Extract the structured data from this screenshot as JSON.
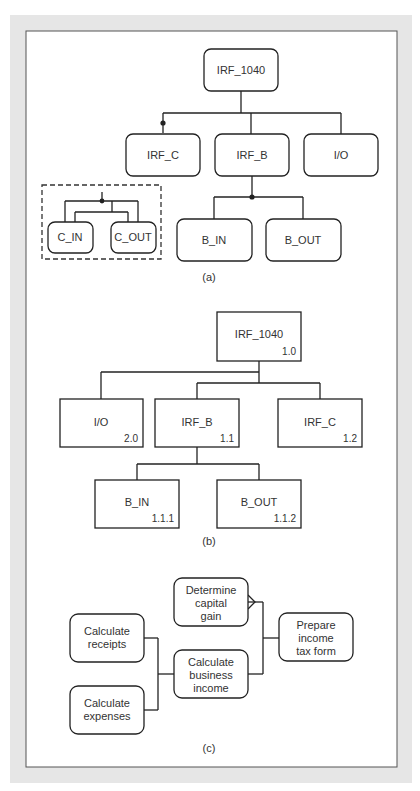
{
  "frame": {
    "outer_color": "#e6e6e6",
    "inner_color": "#ffffff"
  },
  "diagram_a": {
    "caption": "(a)",
    "root": "IRF_1040",
    "children": [
      "IRF_C",
      "IRF_B",
      "I/O"
    ],
    "irf_b_children": [
      "B_IN",
      "B_OUT"
    ],
    "inset_children": [
      "C_IN",
      "C_OUT"
    ]
  },
  "diagram_b": {
    "caption": "(b)",
    "root": {
      "label": "IRF_1040",
      "num": "1.0"
    },
    "children": [
      {
        "label": "I/O",
        "num": "2.0"
      },
      {
        "label": "IRF_B",
        "num": "1.1"
      },
      {
        "label": "IRF_C",
        "num": "1.2"
      }
    ],
    "irf_b_children": [
      {
        "label": "B_IN",
        "num": "1.1.1"
      },
      {
        "label": "B_OUT",
        "num": "1.1.2"
      }
    ]
  },
  "diagram_c": {
    "caption": "(c)",
    "determine": [
      "Determine",
      "capital",
      "gain"
    ],
    "receipts": [
      "Calculate",
      "receipts"
    ],
    "expenses": [
      "Calculate",
      "expenses"
    ],
    "business": [
      "Calculate",
      "business",
      "income"
    ],
    "prepare": [
      "Prepare",
      "income",
      "tax form"
    ]
  }
}
